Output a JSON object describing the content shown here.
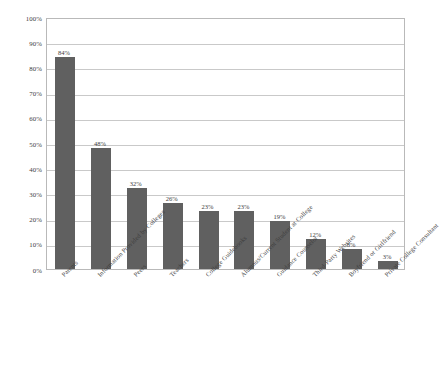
{
  "chart_data": {
    "type": "bar",
    "title": "",
    "subtitle": "",
    "xlabel": "",
    "ylabel": "",
    "ylim": [
      0,
      100
    ],
    "ytick_labels": [
      "100%",
      "90%",
      "80%",
      "70%",
      "60%",
      "50%",
      "40%",
      "30%",
      "20%",
      "10%",
      "0%"
    ],
    "ytick_values": [
      100,
      90,
      80,
      70,
      60,
      50,
      40,
      30,
      20,
      10,
      0
    ],
    "grid": true,
    "legend": "none",
    "orientation": "vertical",
    "bar_color": "#606060",
    "gridline_color": "#c9c9c9",
    "plot_border_color": "#b9b9b9",
    "background_color": "#ffffff",
    "categories": [
      "Parents",
      "Information Provided by Colleges",
      "Peers",
      "Teachers",
      "College Guidebooks",
      "Alumnus/Current Student at College",
      "Guidance Counselor",
      "Third-Party Websites",
      "Boyfriend or Girlfriend",
      "Private College Consultant"
    ],
    "values": [
      84,
      48,
      32,
      26,
      23,
      23,
      19,
      12,
      8,
      3
    ],
    "value_labels": [
      "84%",
      "48%",
      "32%",
      "26%",
      "23%",
      "23%",
      "19%",
      "12%",
      "8%",
      "3%"
    ]
  }
}
